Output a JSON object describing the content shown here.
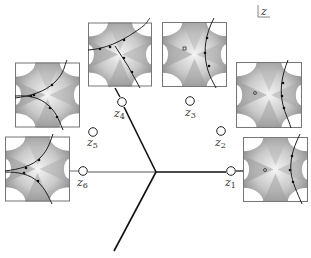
{
  "figure": {
    "plane_label": "z",
    "center": [
      156,
      172
    ],
    "edges": [
      {
        "id": "left",
        "from": [
          156,
          172
        ],
        "to": [
          88,
          172
        ],
        "color": "#888888"
      },
      {
        "id": "right",
        "from": [
          156,
          172
        ],
        "to": [
          226,
          172
        ],
        "color": "#111111"
      },
      {
        "id": "upper-left",
        "from": [
          156,
          172
        ],
        "to": [
          124,
          107
        ],
        "color": "#111111"
      },
      {
        "id": "lower-left",
        "from": [
          156,
          172
        ],
        "to": [
          114,
          251
        ],
        "color": "#111111"
      }
    ],
    "points": [
      {
        "name": "z",
        "sub": "1",
        "x": 231,
        "y": 171,
        "lx": 226,
        "ly": 185
      },
      {
        "name": "z",
        "sub": "2",
        "x": 221,
        "y": 131,
        "lx": 216,
        "ly": 145
      },
      {
        "name": "z",
        "sub": "3",
        "x": 190,
        "y": 101,
        "lx": 185,
        "ly": 116
      },
      {
        "name": "z",
        "sub": "4",
        "x": 122,
        "y": 102,
        "lx": 114,
        "ly": 117
      },
      {
        "name": "z",
        "sub": "5",
        "x": 93,
        "y": 132,
        "lx": 88,
        "ly": 146
      },
      {
        "name": "z",
        "sub": "6",
        "x": 83,
        "y": 171,
        "lx": 78,
        "ly": 185
      }
    ],
    "panels": [
      {
        "id": "panel-z4",
        "x": 88,
        "y": 21,
        "w": 64,
        "h": 67,
        "marker": false
      },
      {
        "id": "panel-z3",
        "x": 162,
        "y": 21,
        "w": 65,
        "h": 67,
        "marker": true
      },
      {
        "id": "panel-z5",
        "x": 15,
        "y": 62,
        "w": 65,
        "h": 66,
        "marker": false
      },
      {
        "id": "panel-z2",
        "x": 234,
        "y": 62,
        "w": 70,
        "h": 66,
        "marker": true
      },
      {
        "id": "panel-z6",
        "x": 5,
        "y": 136,
        "w": 65,
        "h": 66,
        "marker": false
      },
      {
        "id": "panel-z1",
        "x": 243,
        "y": 136,
        "w": 65,
        "h": 67,
        "marker": true
      }
    ]
  }
}
